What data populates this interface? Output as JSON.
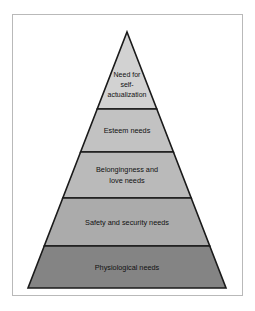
{
  "figure": {
    "background_color": "#ffffff",
    "frame_color": "#b9b9b9",
    "outline_color": "#1a1a1a"
  },
  "chart_data": {
    "type": "pie",
    "xlabel": "",
    "ylabel": "",
    "categories": [
      "Need for self-actualization",
      "Esteem needs",
      "Belongingness and love needs",
      "Safety and security needs",
      "Physiological needs"
    ],
    "values": [
      1,
      2,
      3,
      4,
      5
    ],
    "levels": [
      {
        "rank": 5,
        "label": "Need for self-actualization",
        "lines": [
          "Need for",
          "self-",
          "actualization"
        ],
        "fill": "#d2d2d2",
        "y_top": 32,
        "y_bottom": 109
      },
      {
        "rank": 4,
        "label": "Esteem needs",
        "lines": [
          "Esteem needs"
        ],
        "fill": "#c2c2c2",
        "y_top": 109,
        "y_bottom": 152
      },
      {
        "rank": 3,
        "label": "Belongingness and love needs",
        "lines": [
          "Belongingness and",
          "love needs"
        ],
        "fill": "#bababa",
        "y_top": 152,
        "y_bottom": 198
      },
      {
        "rank": 2,
        "label": "Safety and security needs",
        "lines": [
          "Safety and security needs"
        ],
        "fill": "#ababab",
        "y_top": 198,
        "y_bottom": 246
      },
      {
        "rank": 1,
        "label": "Physiological needs",
        "lines": [
          "Physiological needs"
        ],
        "fill": "#848484",
        "y_top": 246,
        "y_bottom": 288
      }
    ],
    "apex": {
      "x": 127,
      "y": 32
    },
    "base": {
      "left_x": 28,
      "right_x": 226,
      "y": 288
    },
    "legend": "none",
    "grid": false
  },
  "labels": {
    "level5_line1": "Need for",
    "level5_line2": "self-",
    "level5_line3": "actualization",
    "level4_line1": "Esteem needs",
    "level3_line1": "Belongingness and",
    "level3_line2": "love needs",
    "level2_line1": "Safety and security needs",
    "level1_line1": "Physiological needs"
  }
}
